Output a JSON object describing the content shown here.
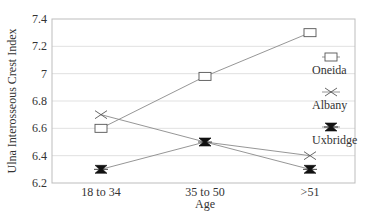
{
  "chart_data": {
    "type": "line",
    "title": "",
    "xlabel": "Age",
    "ylabel": "Ulna Interosseous Crest Index",
    "categories": [
      "18 to 34",
      "35 to 50",
      ">51"
    ],
    "ylim": [
      6.2,
      7.4
    ],
    "yticks": [
      6.2,
      6.4,
      6.6,
      6.8,
      7.0,
      7.2,
      7.4
    ],
    "ytick_labels": [
      "6.2",
      "6.4",
      "6.6",
      "6.8",
      "7",
      "7.2",
      "7.4"
    ],
    "grid": true,
    "legend_position": "right",
    "series": [
      {
        "name": "Oneida",
        "marker": "square",
        "values": [
          6.6,
          6.98,
          7.3
        ]
      },
      {
        "name": "Albany",
        "marker": "x",
        "values": [
          6.7,
          6.5,
          6.4
        ]
      },
      {
        "name": "Uxbridge",
        "marker": "hourglass",
        "values": [
          6.3,
          6.5,
          6.3
        ]
      }
    ],
    "colors": {
      "line": "#8a8a8a",
      "marker": "#555555",
      "filled_marker": "#111111",
      "grid": "#d9d9d9",
      "text": "#333333"
    }
  }
}
